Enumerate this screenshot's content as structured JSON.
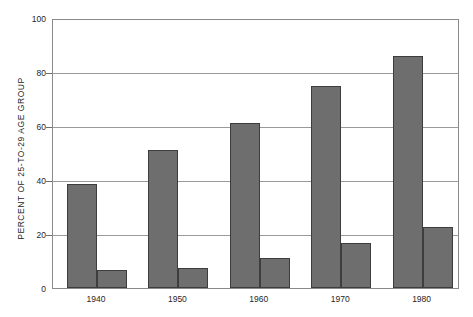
{
  "chart_data": {
    "type": "bar",
    "title": "",
    "xlabel": "",
    "ylabel": "PERCENT OF 25-TO-29 AGE GROUP",
    "categories": [
      "1940",
      "1950",
      "1960",
      "1970",
      "1980"
    ],
    "series": [
      {
        "name": "series-1",
        "values": [
          38.5,
          51,
          61,
          75,
          86
        ]
      },
      {
        "name": "series-2",
        "values": [
          6.5,
          7.5,
          11,
          16.5,
          22.5
        ]
      }
    ],
    "ylim": [
      0,
      100
    ],
    "yticks": [
      0,
      20,
      40,
      60,
      80,
      100
    ],
    "ytick_labels": [
      "0",
      "20",
      "40",
      "60",
      "80",
      "100"
    ],
    "grid": true,
    "legend": "none",
    "bar_color": "#6e6e6e",
    "bar_edge_color": "#3d3d3d",
    "grid_color": "#9a9a9a",
    "frame_color": "#8a8a8a",
    "background": "#ffffff"
  }
}
